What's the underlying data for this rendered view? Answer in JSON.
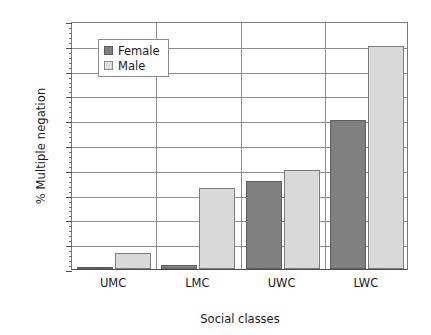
{
  "chart_data": {
    "type": "bar",
    "title": "",
    "subtitle": "",
    "xlabel": "Social classes",
    "ylabel": "% Multiple negation",
    "categories": [
      "UMC",
      "LMC",
      "UWC",
      "LWC"
    ],
    "series": [
      {
        "name": "Female",
        "color": "#808080",
        "values": [
          1,
          1.5,
          35.5,
          60
        ]
      },
      {
        "name": "Male",
        "color": "#d9d9d9",
        "values": [
          6.5,
          32.5,
          40,
          90
        ]
      }
    ],
    "ylim": [
      0,
      100
    ],
    "ytick_step": 10,
    "yticks": [
      0,
      10,
      20,
      30,
      40,
      50,
      60,
      70,
      80,
      90,
      100
    ],
    "ytick_labels": [
      "0",
      "10",
      "20",
      "30",
      "40",
      "50",
      "60",
      "70",
      "80",
      "90",
      "100"
    ],
    "minor_tick_step": 2,
    "grid": {
      "horizontal": true,
      "vertical": true
    },
    "legend": {
      "position": "top-left",
      "entries": [
        "Female",
        "Male"
      ]
    }
  }
}
